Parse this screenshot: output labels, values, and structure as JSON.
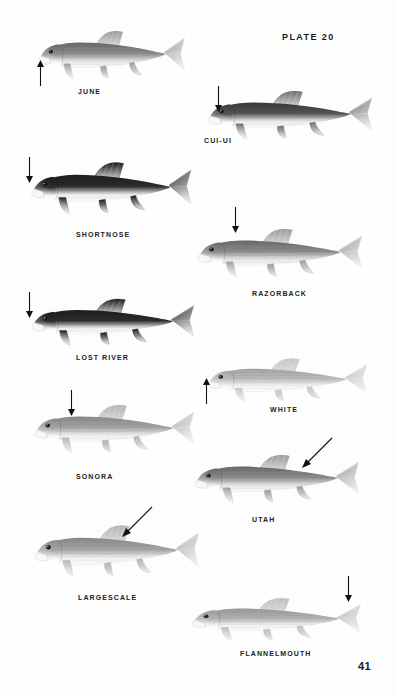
{
  "plate": {
    "title": "PLATE 20",
    "page_number": "41"
  },
  "colors": {
    "ink": "#1a1a1a",
    "paper": "#fdfdfd",
    "label": "#222222",
    "arrow": "#111111"
  },
  "figures": [
    {
      "id": "june",
      "label": "JUNE",
      "common_name": "JUNE",
      "tone": "medium",
      "pointer": "arrow-up",
      "pointer_target": "lower-lip",
      "x": 30,
      "y": 24,
      "w": 160,
      "h": 62,
      "label_x": 78,
      "label_y": 88,
      "arrow_x": 36,
      "arrow_y": 60,
      "arrow_len": 26
    },
    {
      "id": "cui-ui",
      "label": "CUI-UI",
      "common_name": "CUI-UI",
      "tone": "dark",
      "pointer": "arrow-down",
      "pointer_target": "snout",
      "x": 198,
      "y": 84,
      "w": 180,
      "h": 62,
      "label_x": 204,
      "label_y": 137,
      "arrow_x": 214,
      "arrow_y": 86,
      "arrow_len": 26
    },
    {
      "id": "shortnose",
      "label": "SHORTNOSE",
      "common_name": "SHORTNOSE",
      "tone": "very-dark",
      "pointer": "arrow-down",
      "pointer_target": "snout",
      "x": 22,
      "y": 155,
      "w": 175,
      "h": 66,
      "label_x": 76,
      "label_y": 231,
      "arrow_x": 25,
      "arrow_y": 157,
      "arrow_len": 26
    },
    {
      "id": "razorback",
      "label": "RAZORBACK",
      "common_name": "RAZORBACK",
      "tone": "medium",
      "pointer": "arrow-down",
      "pointer_target": "nape-keel",
      "x": 188,
      "y": 222,
      "w": 180,
      "h": 62,
      "label_x": 252,
      "label_y": 290,
      "arrow_x": 231,
      "arrow_y": 207,
      "arrow_len": 26
    },
    {
      "id": "lost-river",
      "label": "LOST RIVER",
      "common_name": "LOST RIVER",
      "tone": "very-dark",
      "pointer": "arrow-down",
      "pointer_target": "snout",
      "x": 22,
      "y": 292,
      "w": 178,
      "h": 60,
      "label_x": 76,
      "label_y": 354,
      "arrow_x": 25,
      "arrow_y": 292,
      "arrow_len": 26
    },
    {
      "id": "white",
      "label": "WHITE",
      "common_name": "WHITE",
      "tone": "light",
      "pointer": "arrow-up",
      "pointer_target": "lower-lip",
      "x": 198,
      "y": 352,
      "w": 175,
      "h": 56,
      "label_x": 270,
      "label_y": 406,
      "arrow_x": 202,
      "arrow_y": 378,
      "arrow_len": 26
    },
    {
      "id": "sonora",
      "label": "SONORA",
      "common_name": "SONORA",
      "tone": "medium-light",
      "pointer": "arrow-down",
      "pointer_target": "nape",
      "x": 25,
      "y": 398,
      "w": 175,
      "h": 62,
      "label_x": 76,
      "label_y": 473,
      "arrow_x": 67,
      "arrow_y": 390,
      "arrow_len": 26
    },
    {
      "id": "utah",
      "label": "UTAH",
      "common_name": "UTAH",
      "tone": "medium",
      "pointer": "arrow-diagonal",
      "pointer_target": "dorsal-fin",
      "x": 185,
      "y": 448,
      "w": 180,
      "h": 62,
      "label_x": 252,
      "label_y": 516,
      "arrow_x": 300,
      "arrow_y": 436,
      "arrow_len": 34
    },
    {
      "id": "largescale",
      "label": "LARGESCALE",
      "common_name": "LARGESCALE",
      "tone": "medium-light",
      "pointer": "arrow-diagonal",
      "pointer_target": "dorsal-fin",
      "x": 25,
      "y": 518,
      "w": 180,
      "h": 66,
      "label_x": 78,
      "label_y": 594,
      "arrow_x": 120,
      "arrow_y": 505,
      "arrow_len": 34
    },
    {
      "id": "flannelmouth",
      "label": "FLANNELMOUTH",
      "common_name": "FLANNELMOUTH",
      "tone": "light-speckled",
      "pointer": "arrow-down",
      "pointer_target": "caudal-peduncle",
      "x": 182,
      "y": 592,
      "w": 185,
      "h": 55,
      "label_x": 240,
      "label_y": 650,
      "arrow_x": 344,
      "arrow_y": 576,
      "arrow_len": 26
    }
  ]
}
